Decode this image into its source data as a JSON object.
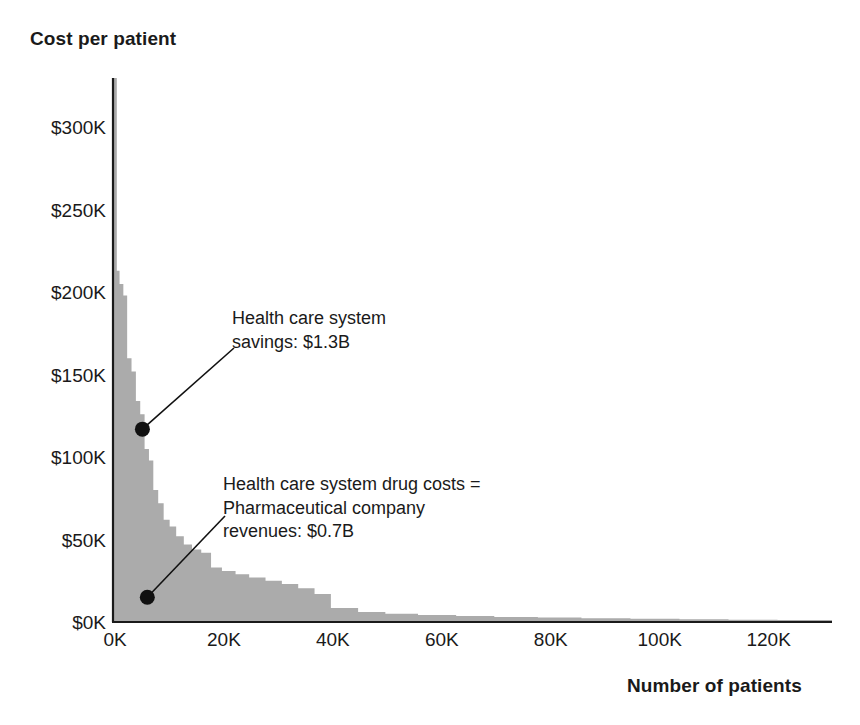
{
  "chart_data": {
    "type": "area",
    "title": "",
    "xlabel": "Number of patients",
    "ylabel": "Cost per patient",
    "xlim": [
      0,
      132000
    ],
    "ylim": [
      0,
      330000
    ],
    "grid": false,
    "legend_position": "none",
    "y_ticks": [
      {
        "value": 300000,
        "label": "$300K"
      },
      {
        "value": 250000,
        "label": "$250K"
      },
      {
        "value": 200000,
        "label": "$200K"
      },
      {
        "value": 150000,
        "label": "$150K"
      },
      {
        "value": 100000,
        "label": "$100K"
      },
      {
        "value": 50000,
        "label": "$50K"
      },
      {
        "value": 0,
        "label": "$0K"
      }
    ],
    "x_ticks": [
      {
        "value": 0,
        "label": "0K"
      },
      {
        "value": 20000,
        "label": "20K"
      },
      {
        "value": 40000,
        "label": "40K"
      },
      {
        "value": 60000,
        "label": "60K"
      },
      {
        "value": 80000,
        "label": "80K"
      },
      {
        "value": 100000,
        "label": "100K"
      },
      {
        "value": 120000,
        "label": "120K"
      }
    ],
    "series": [
      {
        "name": "Health care system drug costs = Pharmaceutical company revenues",
        "color": "#d2d2d2",
        "stack_order": "bottom",
        "x": [
          0,
          300,
          700,
          1200,
          1900,
          2600,
          3400,
          4200,
          5000,
          5800,
          6600,
          7400,
          8300,
          9300,
          10400,
          11600,
          13000,
          14500,
          16200,
          18000,
          20000,
          22500,
          25000,
          28000,
          31000,
          34000,
          37000,
          40000,
          45000,
          50000,
          56000,
          63000,
          70000,
          78000,
          86000,
          95000,
          104000,
          113000,
          122000,
          132000
        ],
        "y": [
          330000,
          180000,
          120000,
          95000,
          78000,
          63000,
          54000,
          47000,
          40000,
          34000,
          29000,
          25000,
          22000,
          19500,
          17500,
          16000,
          15000,
          14000,
          13200,
          12500,
          11800,
          11000,
          10200,
          9300,
          8400,
          7500,
          6300,
          4200,
          3200,
          2600,
          2200,
          1900,
          1600,
          1400,
          1200,
          1000,
          850,
          700,
          600,
          500
        ]
      },
      {
        "name": "Health care system savings",
        "color": "#ababab",
        "stack_order": "top",
        "x": [
          0,
          300,
          700,
          1200,
          1900,
          2600,
          3400,
          4200,
          5000,
          5800,
          6600,
          7400,
          8300,
          9300,
          10400,
          11600,
          13000,
          14500,
          16200,
          18000,
          20000,
          22500,
          25000,
          28000,
          31000,
          34000,
          37000,
          40000,
          45000,
          50000,
          56000,
          63000,
          70000,
          78000,
          86000,
          95000,
          104000,
          113000,
          122000,
          132000
        ],
        "y_total": [
          330000,
          330000,
          213000,
          205000,
          198000,
          160000,
          152000,
          134000,
          126000,
          105000,
          98000,
          80000,
          72000,
          62000,
          58000,
          52000,
          47000,
          44000,
          42000,
          33000,
          31000,
          29000,
          27000,
          25000,
          23000,
          20500,
          17000,
          8500,
          6000,
          5000,
          4200,
          3600,
          3100,
          2700,
          2300,
          2000,
          1700,
          1400,
          1200,
          900
        ]
      }
    ],
    "annotations": [
      {
        "id": "savings-annotation",
        "text": "Health care system\nsavings: $1.3B",
        "value": "$1.3B",
        "point_x": 5400,
        "point_y": 117000
      },
      {
        "id": "drug-costs-annotation",
        "text": "Health care system drug costs =\nPharmaceutical company\nrevenues: $0.7B",
        "value": "$0.7B",
        "point_x": 6300,
        "point_y": 15000
      }
    ]
  },
  "axes": {
    "y_title": "Cost per patient",
    "x_title": "Number of patients"
  },
  "colors": {
    "axis": "#1a1a1a",
    "text": "#1a1a1a",
    "series_bottom": "#d2d2d2",
    "series_top": "#ababab",
    "annotation_marker": "#111111",
    "background": "#ffffff"
  }
}
